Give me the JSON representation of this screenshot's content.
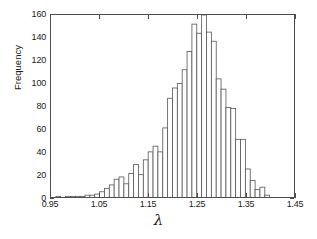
{
  "chart_data": {
    "type": "bar",
    "title": "",
    "subtitle": "",
    "xlabel": "λ",
    "ylabel": "Frequency",
    "xlim": [
      0.95,
      1.45
    ],
    "ylim": [
      0,
      160
    ],
    "grid": false,
    "legend": null,
    "bin_width": 0.01,
    "x_tick_labels": [
      "0.95",
      "1.05",
      "1.15",
      "1.25",
      "1.35",
      "1.45"
    ],
    "x_tick_values": [
      0.95,
      1.05,
      1.15,
      1.25,
      1.35,
      1.45
    ],
    "y_tick_labels": [
      "0",
      "20",
      "40",
      "60",
      "80",
      "100",
      "120",
      "140",
      "160"
    ],
    "y_tick_values": [
      0,
      20,
      40,
      60,
      80,
      100,
      120,
      140,
      160
    ],
    "bar_face_color": "#ffffff",
    "bar_edge_color": "#555555",
    "axis_color": "#4d4d4d",
    "background_color": "#ffffff",
    "categories": [
      "0.965",
      "0.975",
      "0.985",
      "0.995",
      "1.005",
      "1.015",
      "1.025",
      "1.035",
      "1.045",
      "1.055",
      "1.065",
      "1.075",
      "1.085",
      "1.095",
      "1.105",
      "1.115",
      "1.125",
      "1.135",
      "1.145",
      "1.155",
      "1.165",
      "1.175",
      "1.185",
      "1.195",
      "1.205",
      "1.215",
      "1.225",
      "1.235",
      "1.245",
      "1.255",
      "1.265",
      "1.275",
      "1.285",
      "1.295",
      "1.305",
      "1.315",
      "1.325",
      "1.335",
      "1.345",
      "1.355",
      "1.365",
      "1.375",
      "1.385",
      "1.395"
    ],
    "values": [
      1,
      0,
      1,
      1,
      1,
      1,
      2,
      2,
      3,
      5,
      8,
      11,
      16,
      18,
      12,
      21,
      29,
      20,
      33,
      40,
      45,
      40,
      61,
      87,
      96,
      100,
      112,
      128,
      152,
      144,
      160,
      145,
      137,
      104,
      95,
      79,
      78,
      51,
      51,
      25,
      15,
      7,
      9,
      2
    ],
    "values_max": 160,
    "values_max_category": "1.265",
    "n_bins": 44
  }
}
